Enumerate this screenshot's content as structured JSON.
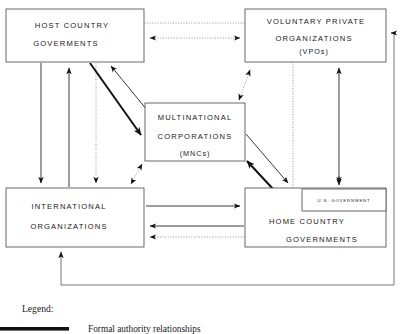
{
  "diagram": {
    "boxes": [
      {
        "id": "host-country-governments",
        "lines": [
          "HOST COUNTRY",
          "GOVERMENTS"
        ],
        "x": 6,
        "y": 9,
        "w": 138,
        "h": 53
      },
      {
        "id": "voluntary-private-organizations",
        "lines": [
          "VOLUNTARY PRIVATE",
          "ORGANIZATIONS",
          "(VPOs)"
        ],
        "x": 245,
        "y": 9,
        "w": 141,
        "h": 53
      },
      {
        "id": "multinational-corporations",
        "lines": [
          "MULTINATIONAL",
          "CORPORATIONS",
          "(MNCs)"
        ],
        "x": 145,
        "y": 103,
        "w": 100,
        "h": 58
      },
      {
        "id": "international-organizations",
        "lines": [
          "INTERNATIONAL",
          "ORGANIZATIONS"
        ],
        "x": 6,
        "y": 188,
        "w": 138,
        "h": 59
      },
      {
        "id": "home-country-governments",
        "lines": [
          "HOME COUNTRY",
          "GOVERNMENTS"
        ],
        "x": 245,
        "y": 188,
        "w": 141,
        "h": 59
      },
      {
        "id": "us-government",
        "lines": [
          "U.S. GOVERNMENT"
        ],
        "x": 302,
        "y": 189,
        "w": 84,
        "h": 22
      }
    ],
    "legend": {
      "title": "Legend:",
      "entries": [
        {
          "id": "formal-authority",
          "style": "thick-solid-line",
          "label": "Formal authority relationships"
        }
      ]
    },
    "relationship_styles": {
      "formal_authority": "thick solid line",
      "secondary": "thin solid line",
      "informal": "dotted line"
    },
    "colors": {
      "box_border": "#5a5a5a",
      "thick_line": "#111111",
      "thin_line": "#3a3a3a",
      "dotted_line": "#8a8a8a",
      "text": "#1a1a1a",
      "background": "#ffffff"
    }
  }
}
